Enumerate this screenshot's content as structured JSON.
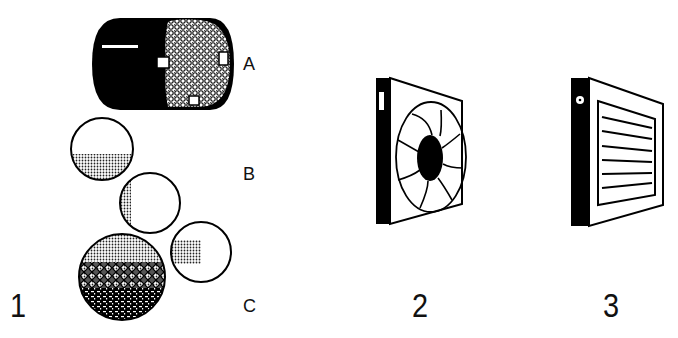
{
  "figure": {
    "panels": [
      {
        "number": "1",
        "items": [
          {
            "letter": "A",
            "shape": "cylinder-with-textured-end-and-tabs"
          },
          {
            "letter": "B",
            "shape": "circles-with-half-shading"
          },
          {
            "letter": "C",
            "shape": "circles-with-patterned-fill"
          }
        ]
      },
      {
        "number": "2",
        "shape": "square-panel-with-fan-iris"
      },
      {
        "number": "3",
        "shape": "square-panel-with-louvers"
      }
    ],
    "panel2_side_mark": "1",
    "colors": {
      "ink": "#111111",
      "paper": "#ffffff",
      "shade": "#9a9a9a"
    }
  }
}
